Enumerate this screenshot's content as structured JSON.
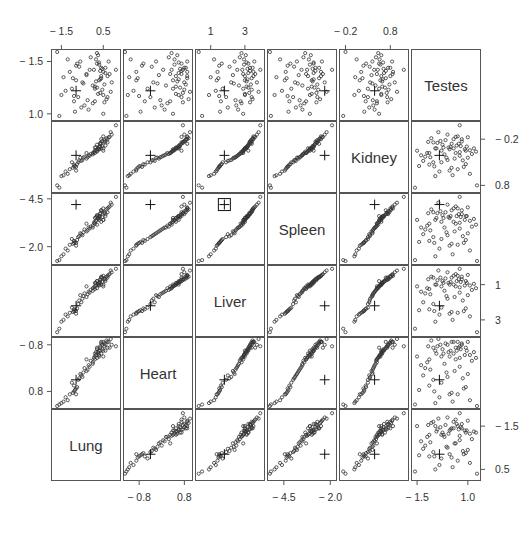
{
  "chart_data": {
    "type": "scatter",
    "subtype": "scatterplot-matrix",
    "title": "",
    "variables": [
      "Lung",
      "Heart",
      "Liver",
      "Spleen",
      "Kidney",
      "Testes"
    ],
    "diagonal_order_top_to_bottom": [
      "Testes",
      "Kidney",
      "Spleen",
      "Liver",
      "Heart",
      "Lung"
    ],
    "axes": {
      "Lung": {
        "ticks": [
          -1.5,
          0.5
        ],
        "labels": [
          "-1.5",
          "0.5"
        ],
        "range": [
          -1.9,
          1.2
        ],
        "x_side": "top",
        "y_side": "right"
      },
      "Heart": {
        "ticks": [
          -0.8,
          0.8
        ],
        "labels": [
          "-0.8",
          "0.8"
        ],
        "range": [
          -1.3,
          1.0
        ],
        "x_side": "bottom",
        "y_side": "left"
      },
      "Liver": {
        "ticks": [
          1,
          3
        ],
        "labels": [
          "1",
          "3"
        ],
        "range": [
          0.2,
          4.0
        ],
        "x_side": "top",
        "y_side": "right"
      },
      "Spleen": {
        "ticks": [
          -4.5,
          -2.0
        ],
        "labels": [
          "-4.5",
          "-2.0"
        ],
        "range": [
          -5.3,
          -1.8
        ],
        "x_side": "bottom",
        "y_side": "left"
      },
      "Kidney": {
        "ticks": [
          -0.2,
          0.8
        ],
        "labels": [
          "-0.2",
          "0.8"
        ],
        "range": [
          -0.3,
          1.15
        ],
        "x_side": "top",
        "y_side": "right"
      },
      "Testes": {
        "ticks": [
          -1.5,
          1.0
        ],
        "labels": [
          "-1.5",
          "1.0"
        ],
        "range": [
          -1.7,
          1.5
        ],
        "x_side": "bottom",
        "y_side": "left"
      }
    },
    "highlight": {
      "marker": "cross",
      "note": "one observation plotted as '+' in every panel; boxed in Spleen vs Liver panel",
      "values": {
        "Lung": -0.8,
        "Heart": -0.4,
        "Liver": 1.8,
        "Spleen": -2.3,
        "Kidney": 0.45,
        "Testes": -0.4
      }
    },
    "observations": [
      [
        0.2,
        0.7,
        3.2,
        -2.9,
        0.55,
        0.9
      ],
      [
        0.4,
        0.9,
        3.4,
        -2.6,
        0.7,
        0.2
      ],
      [
        0.5,
        0.6,
        3.0,
        -3.1,
        0.6,
        -0.6
      ],
      [
        -0.3,
        0.3,
        2.9,
        -3.3,
        0.5,
        0.4
      ],
      [
        0.1,
        0.5,
        3.1,
        -3.0,
        0.62,
        -0.2
      ],
      [
        0.6,
        0.8,
        3.3,
        -2.8,
        0.75,
        0.7
      ],
      [
        -0.6,
        -0.2,
        2.4,
        -3.8,
        0.4,
        1.0
      ],
      [
        0.3,
        0.4,
        3.0,
        -3.0,
        0.58,
        0.1
      ],
      [
        -0.9,
        -0.6,
        1.6,
        -4.2,
        0.25,
        -0.9
      ],
      [
        -0.8,
        -0.7,
        1.5,
        -4.3,
        0.2,
        0.8
      ],
      [
        -1.0,
        -0.5,
        1.7,
        -4.1,
        0.3,
        -0.3
      ],
      [
        0.0,
        0.2,
        2.8,
        -3.4,
        0.5,
        -1.0
      ],
      [
        0.7,
        0.9,
        3.5,
        -2.5,
        0.8,
        0.3
      ],
      [
        0.45,
        0.65,
        3.15,
        -2.95,
        0.65,
        0.65
      ],
      [
        -0.2,
        0.1,
        2.6,
        -3.5,
        0.45,
        -1.3
      ],
      [
        0.25,
        0.55,
        3.05,
        -3.05,
        0.6,
        1.3
      ],
      [
        -1.1,
        -0.9,
        1.4,
        -4.4,
        0.15,
        0.5
      ],
      [
        0.35,
        0.75,
        3.25,
        -2.75,
        0.72,
        -0.5
      ],
      [
        -0.5,
        -0.3,
        2.2,
        -3.9,
        0.35,
        0.0
      ],
      [
        0.55,
        0.85,
        3.35,
        -2.7,
        0.78,
        -0.1
      ],
      [
        0.15,
        0.45,
        2.95,
        -3.15,
        0.56,
        1.1
      ],
      [
        -0.7,
        -0.4,
        1.9,
        -4.0,
        0.3,
        -0.7
      ],
      [
        0.8,
        0.7,
        3.6,
        -2.4,
        0.85,
        0.4
      ],
      [
        -1.3,
        -1.0,
        1.3,
        -4.6,
        0.1,
        -0.4
      ],
      [
        0.05,
        0.35,
        2.85,
        -3.25,
        0.52,
        0.6
      ],
      [
        -0.4,
        0.0,
        2.5,
        -3.6,
        0.42,
        -1.1
      ],
      [
        0.65,
        0.95,
        3.45,
        -2.55,
        0.82,
        -0.8
      ],
      [
        0.3,
        0.6,
        3.1,
        -2.9,
        0.64,
        0.95
      ],
      [
        -0.85,
        -0.75,
        1.55,
        -4.25,
        0.22,
        -1.4
      ],
      [
        0.4,
        0.5,
        3.0,
        -3.2,
        0.6,
        0.3
      ],
      [
        -0.1,
        0.25,
        2.7,
        -3.45,
        0.48,
        1.2
      ],
      [
        0.9,
        0.8,
        3.7,
        -2.3,
        0.9,
        0.0
      ],
      [
        -0.95,
        -0.85,
        1.45,
        -4.35,
        0.18,
        0.2
      ],
      [
        0.2,
        0.65,
        3.2,
        -2.85,
        0.68,
        -0.25
      ],
      [
        0.5,
        0.4,
        2.9,
        -3.1,
        0.55,
        -1.5
      ],
      [
        -0.65,
        -0.35,
        2.1,
        -3.95,
        0.34,
        0.75
      ],
      [
        0.35,
        0.7,
        3.3,
        -2.8,
        0.7,
        0.55
      ],
      [
        -1.5,
        -1.2,
        0.9,
        -5.0,
        0.0,
        -0.6
      ],
      [
        0.1,
        0.3,
        2.75,
        -3.3,
        0.5,
        -0.9
      ],
      [
        0.75,
        0.9,
        3.55,
        -2.45,
        0.84,
        1.0
      ],
      [
        -0.3,
        -0.1,
        2.3,
        -3.7,
        0.38,
        0.35
      ],
      [
        0.45,
        0.8,
        3.4,
        -2.65,
        0.76,
        -0.35
      ],
      [
        -0.75,
        -0.65,
        1.65,
        -4.15,
        0.26,
        0.9
      ],
      [
        0.25,
        0.5,
        3.0,
        -3.0,
        0.6,
        -0.55
      ],
      [
        -1.2,
        -1.1,
        1.2,
        -4.7,
        0.05,
        1.1
      ],
      [
        0.6,
        0.6,
        3.2,
        -2.9,
        0.66,
        0.45
      ],
      [
        0.0,
        0.15,
        2.65,
        -3.5,
        0.47,
        -0.15
      ],
      [
        -0.55,
        -0.25,
        2.0,
        -3.85,
        0.33,
        -1.2
      ],
      [
        0.3,
        0.45,
        2.95,
        -3.1,
        0.58,
        0.85
      ],
      [
        0.85,
        1.0,
        3.8,
        -2.2,
        0.95,
        -0.45
      ],
      [
        -0.9,
        -0.8,
        1.5,
        -4.3,
        0.21,
        -0.65
      ],
      [
        0.15,
        0.55,
        3.1,
        -2.95,
        0.62,
        0.05
      ],
      [
        -0.15,
        0.05,
        2.55,
        -3.55,
        0.44,
        0.6
      ],
      [
        0.55,
        0.75,
        3.3,
        -2.75,
        0.74,
        -0.95
      ],
      [
        -1.4,
        -1.15,
        1.0,
        -4.9,
        0.02,
        0.25
      ],
      [
        0.4,
        0.85,
        3.45,
        -2.6,
        0.8,
        0.7
      ],
      [
        -0.45,
        -0.15,
        2.35,
        -3.75,
        0.4,
        -0.05
      ],
      [
        0.2,
        0.35,
        2.8,
        -3.35,
        0.53,
        1.4
      ],
      [
        0.7,
        0.7,
        3.4,
        -2.7,
        0.73,
        -0.7
      ],
      [
        -0.8,
        -0.9,
        1.35,
        -4.45,
        0.12,
        0.1
      ],
      [
        0.1,
        0.4,
        2.9,
        -3.2,
        0.55,
        -0.3
      ],
      [
        0.5,
        0.9,
        3.5,
        -2.5,
        0.86,
        0.5
      ],
      [
        -0.25,
        -0.05,
        2.45,
        -3.65,
        0.41,
        -0.85
      ],
      [
        0.35,
        0.6,
        3.15,
        -2.9,
        0.63,
        0.15
      ],
      [
        1.1,
        0.75,
        3.9,
        -1.9,
        1.1,
        0.6
      ],
      [
        -1.6,
        -1.25,
        0.5,
        -5.2,
        -0.25,
        -1.6
      ],
      [
        -1.7,
        -1.3,
        0.3,
        -5.25,
        -0.2,
        1.45
      ]
    ]
  },
  "labels": {
    "diag": [
      "Testes",
      "Kidney",
      "Spleen",
      "Liver",
      "Heart",
      "Lung"
    ],
    "top": [
      {
        "col": 0,
        "texts": [
          "-1.5",
          "0.5"
        ]
      },
      {
        "col": 2,
        "texts": [
          "1",
          "3"
        ]
      },
      {
        "col": 4,
        "texts": [
          "-0.2",
          "0.8"
        ]
      }
    ],
    "bottom": [
      {
        "col": 1,
        "texts": [
          "-0.8",
          "0.8"
        ]
      },
      {
        "col": 3,
        "texts": [
          "-4.5",
          "-2.0"
        ]
      },
      {
        "col": 5,
        "texts": [
          "-1.5",
          "1.0"
        ]
      }
    ],
    "left": [
      {
        "row": 0,
        "texts": [
          "1.0",
          "-1.5"
        ]
      },
      {
        "row": 2,
        "texts": [
          "-2.0",
          "-4.5"
        ]
      },
      {
        "row": 4,
        "texts": [
          "0.8",
          "-0.8"
        ]
      }
    ],
    "right": [
      {
        "row": 1,
        "texts": [
          "0.8",
          "-0.2"
        ]
      },
      {
        "row": 3,
        "texts": [
          "3",
          "1"
        ]
      },
      {
        "row": 5,
        "texts": [
          "0.5",
          "-1.5"
        ]
      }
    ]
  }
}
